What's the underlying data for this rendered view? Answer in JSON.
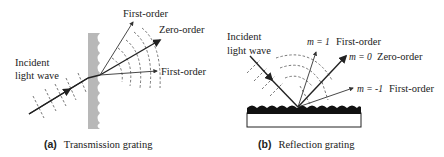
{
  "panel_a": {
    "incident_label_line1": "Incident",
    "incident_label_line2": "light wave",
    "first_order_top": "First-order",
    "zero_order": "Zero-order",
    "first_order_bottom": "First-order",
    "caption_tag": "(a)",
    "caption_text": "Transmission grating",
    "grating_color": "#b8b8b8"
  },
  "panel_b": {
    "incident_label_line1": "Incident",
    "incident_label_line2": "light wave",
    "m_plus1": "m = 1",
    "first_order_top": "First-order",
    "m_zero": "m = 0",
    "zero_order": "Zero-order",
    "m_minus1": "m = -1",
    "first_order_bottom": "First-order",
    "caption_tag": "(b)",
    "caption_text": "Reflection grating"
  }
}
